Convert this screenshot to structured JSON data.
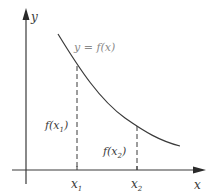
{
  "diagram": {
    "y_axis_label": "y",
    "x_axis_label": "x",
    "curve_label": "y = f(x)",
    "points": [
      {
        "x_label": "x",
        "x_sub": "1",
        "f_label_pre": "f(x",
        "f_sub": "1",
        "f_label_post": ")"
      },
      {
        "x_label": "x",
        "x_sub": "2",
        "f_label_pre": "f(x",
        "f_sub": "2",
        "f_label_post": ")"
      }
    ],
    "colors": {
      "axis": "#3a3a3a",
      "curve": "#3a3a3a",
      "curve_label": "#8a8a8a",
      "dashed": "#3a3a3a"
    }
  }
}
